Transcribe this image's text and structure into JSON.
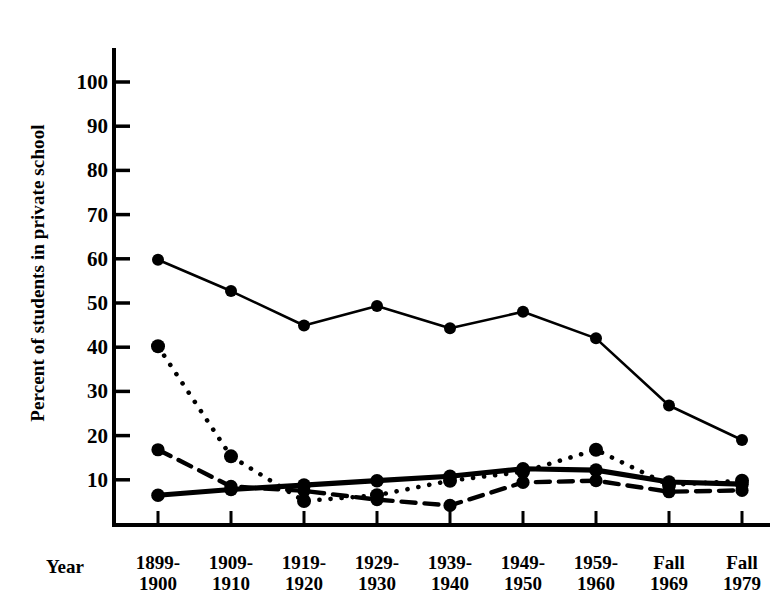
{
  "chart_data": {
    "type": "line",
    "title": "",
    "xlabel": "Year",
    "ylabel": "Percent of students in private school",
    "categories": [
      "1899-1900",
      "1909-1910",
      "1919-1920",
      "1929-1930",
      "1939-1940",
      "1949-1950",
      "1959-1960",
      "Fall 1969",
      "Fall 1979"
    ],
    "category_lines": [
      [
        "1899-",
        "1900"
      ],
      [
        "1909-",
        "1910"
      ],
      [
        "1919-",
        "1920"
      ],
      [
        "1929-",
        "1930"
      ],
      [
        "1939-",
        "1940"
      ],
      [
        "1949-",
        "1950"
      ],
      [
        "1959-",
        "1960"
      ],
      [
        "Fall",
        "1969"
      ],
      [
        "Fall",
        "1979"
      ]
    ],
    "ylim": [
      0,
      105
    ],
    "yticks": [
      10,
      20,
      30,
      40,
      50,
      60,
      70,
      80,
      90,
      100
    ],
    "ytick_labels": [
      "10",
      "20",
      "30",
      "40",
      "50",
      "60",
      "70",
      "80",
      "90",
      "100"
    ],
    "grid": false,
    "legend": "none",
    "series": [
      {
        "name": "series-thin-solid",
        "style": "thin-solid",
        "marker": "filled-circle",
        "values": [
          59.8,
          52.7,
          44.9,
          49.3,
          44.3,
          48.0,
          42.0,
          26.8,
          19.0
        ]
      },
      {
        "name": "series-dotted",
        "style": "dotted",
        "marker": "filled-circle",
        "values": [
          40.2,
          15.3,
          5.2,
          6.5,
          9.8,
          11.8,
          16.8,
          8.8,
          9.8
        ]
      },
      {
        "name": "series-dashed",
        "style": "dashed",
        "marker": "filled-circle",
        "values": [
          16.8,
          8.5,
          7.5,
          5.5,
          4.2,
          9.4,
          9.8,
          7.3,
          7.6
        ]
      },
      {
        "name": "series-thick-solid",
        "style": "thick-solid",
        "marker": "filled-circle",
        "values": [
          6.5,
          7.8,
          8.8,
          9.8,
          10.8,
          12.5,
          12.2,
          9.5,
          9.0
        ]
      }
    ],
    "colors": {
      "ink": "#000000",
      "background": "#ffffff"
    }
  }
}
